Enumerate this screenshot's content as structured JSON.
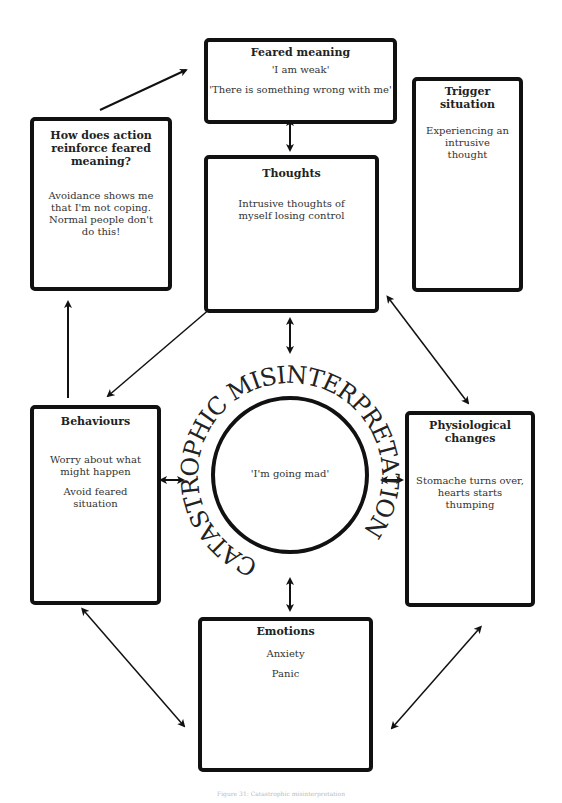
{
  "diagram": {
    "feared_meaning": {
      "title": "Feared meaning",
      "lines": [
        "'I am weak'",
        "'There is something wrong with me'"
      ]
    },
    "trigger_situation": {
      "title": "Trigger situation",
      "lines": [
        "Experiencing an intrusive thought"
      ]
    },
    "reinforce": {
      "title": "How does action reinforce feared meaning?",
      "lines": [
        "Avoidance shows me that I'm not coping. Normal people don't do this!"
      ]
    },
    "thoughts": {
      "title": "Thoughts",
      "lines": [
        "Intrusive thoughts of myself losing control"
      ]
    },
    "behaviours": {
      "title": "Behaviours",
      "lines": [
        "Worry about what might happen",
        "Avoid feared situation"
      ]
    },
    "physiological": {
      "title": "Physiological changes",
      "lines": [
        "Stomache turns over, hearts starts thumping"
      ]
    },
    "emotions": {
      "title": "Emotions",
      "lines": [
        "Anxiety",
        "Panic"
      ]
    },
    "center": {
      "ring_text": "CATASTROPHIC MISINTERPRETATION",
      "inner_text": "'I'm going mad'"
    },
    "caption": "Figure 31: Catastrophic misinterpretation"
  }
}
